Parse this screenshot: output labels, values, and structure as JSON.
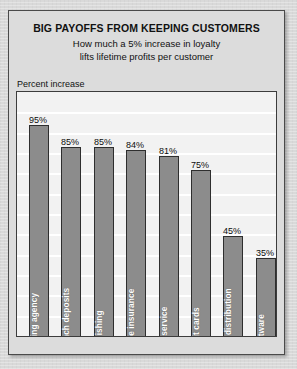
{
  "card": {
    "title": "BIG PAYOFFS FROM KEEPING CUSTOMERS",
    "subtitle_line1": "How much a 5% increase in loyalty",
    "subtitle_line2": "lifts lifetime profits per customer",
    "axis_caption": "Percent increase"
  },
  "colors": {
    "page_background": "#d9d9d9",
    "card_background": "#dcdcdc",
    "card_border": "#4a4a4a",
    "plot_background": "#f2f2f2",
    "plot_border": "#3c3c3c",
    "gridline": "#ffffff",
    "bar_fill": "#8c8c8c",
    "bar_border": "#2e2e2e",
    "bar_label_text": "#ffffff",
    "value_text": "#0d0d0d"
  },
  "chart_data": {
    "type": "bar",
    "title": "BIG PAYOFFS FROM KEEPING CUSTOMERS",
    "subtitle": "How much a 5% increase in loyalty lifts lifetime profits per customer",
    "xlabel": "",
    "ylabel": "Percent increase",
    "ylim": [
      0,
      110
    ],
    "grid": true,
    "gridline_count": 11,
    "legend": "none",
    "orientation": "vertical",
    "categories": [
      "Advertising agency",
      "Bank branch deposits",
      "Publishing",
      "Auto/home insurance",
      "Auto service",
      "Credit cards",
      "Industrial distribution",
      "Software"
    ],
    "values": [
      95,
      85,
      85,
      84,
      81,
      75,
      45,
      35
    ],
    "value_labels": [
      "95%",
      "85%",
      "85%",
      "84%",
      "81%",
      "75%",
      "45%",
      "35%"
    ],
    "bars": [
      {
        "category": "Advertising agency",
        "value": 95,
        "label": "95%"
      },
      {
        "category": "Bank branch deposits",
        "value": 85,
        "label": "85%"
      },
      {
        "category": "Publishing",
        "value": 85,
        "label": "85%"
      },
      {
        "category": "Auto/home insurance",
        "value": 84,
        "label": "84%"
      },
      {
        "category": "Auto service",
        "value": 81,
        "label": "81%"
      },
      {
        "category": "Credit cards",
        "value": 75,
        "label": "75%"
      },
      {
        "category": "Industrial distribution",
        "value": 45,
        "label": "45%"
      },
      {
        "category": "Software",
        "value": 35,
        "label": "35%"
      }
    ]
  }
}
